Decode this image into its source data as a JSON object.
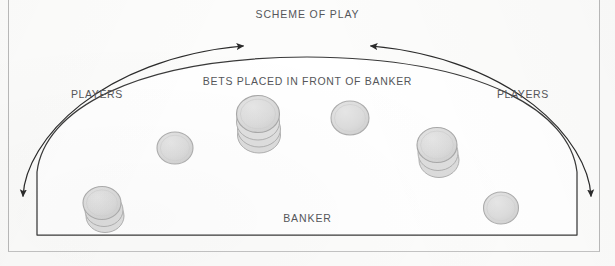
{
  "diagram": {
    "title": "SCHEME OF PLAY",
    "bets_note": "BETS PLACED IN FRONT OF BANKER",
    "banker_label": "BANKER",
    "players_left_label": "PLAYERS",
    "players_right_label": "PLAYERS",
    "table_shape": "arc-topped-semi-ellipse",
    "colors": {
      "page_background": "#fbfbfa",
      "frame_border": "#b9b9b9",
      "table_outline": "#3a3a3a",
      "table_fill": "#ffffff",
      "arrow_stroke": "#2e2e2e",
      "chip_fill": "#d9d9d9",
      "chip_outline": "#b3b3b3",
      "text": "#55565a"
    },
    "arrows": [
      {
        "name": "left-flow-arrow",
        "from": "bottom-left-corner",
        "to": "table-apex-left",
        "direction_at_head": "up-right",
        "second_head": "down-left",
        "double_headed": true
      },
      {
        "name": "right-flow-arrow",
        "from": "bottom-right-corner",
        "to": "table-apex-right",
        "direction_at_head": "up-left",
        "second_head": "down-right",
        "double_headed": true
      }
    ],
    "chip_positions": [
      {
        "name": "chip-stack-bottom-left",
        "cx": 103,
        "cy": 205,
        "rx": 19,
        "ry": 17,
        "chips": 3,
        "type": "stack"
      },
      {
        "name": "chip-single-left",
        "cx": 175,
        "cy": 148,
        "rx": 18,
        "ry": 16,
        "chips": 1,
        "type": "single"
      },
      {
        "name": "chip-stack-center-left",
        "cx": 259,
        "cy": 116,
        "rx": 22,
        "ry": 19,
        "chips": 4,
        "type": "stack"
      },
      {
        "name": "chip-single-center-right",
        "cx": 350,
        "cy": 118,
        "rx": 19,
        "ry": 17,
        "chips": 1,
        "type": "single"
      },
      {
        "name": "chip-stack-right",
        "cx": 438,
        "cy": 147,
        "rx": 20,
        "ry": 18,
        "chips": 3,
        "type": "stack"
      },
      {
        "name": "chip-single-bottom-right",
        "cx": 501,
        "cy": 208,
        "rx": 17,
        "ry": 16,
        "chips": 1,
        "type": "single"
      }
    ],
    "chip_count": 6
  }
}
